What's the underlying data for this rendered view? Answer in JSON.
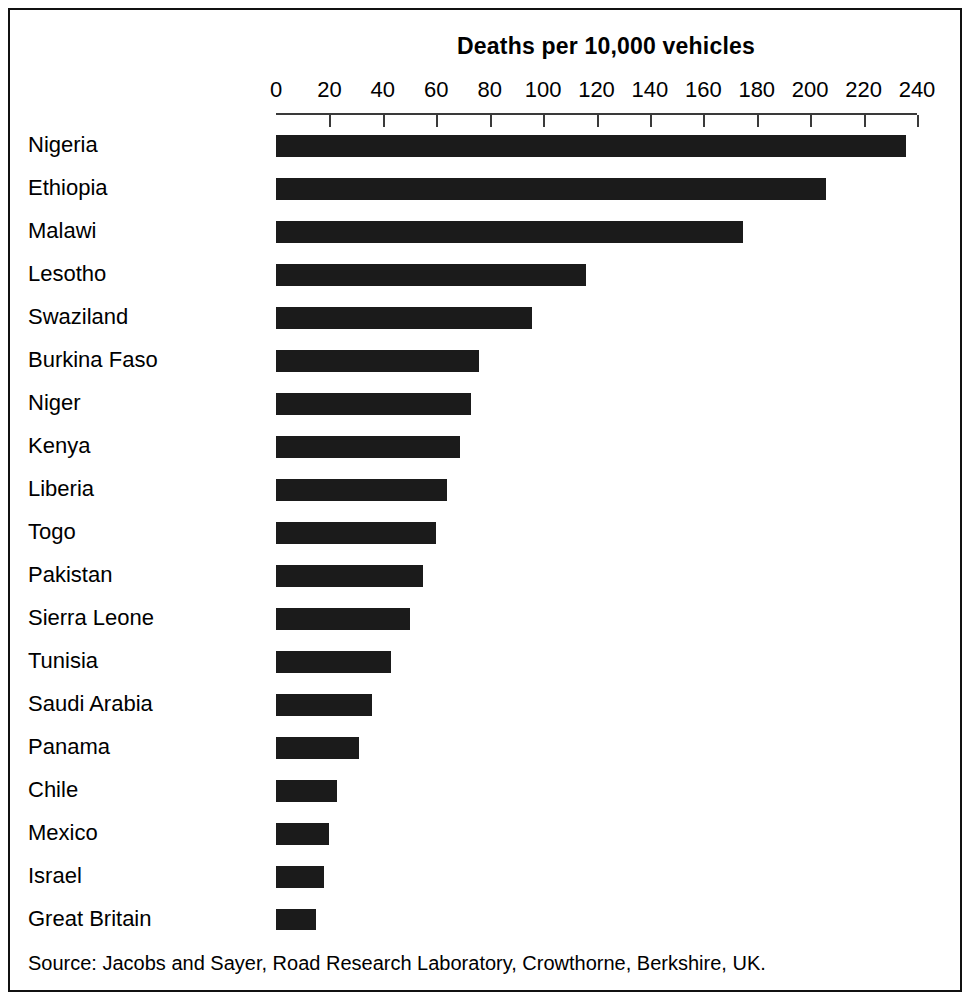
{
  "figure": {
    "title": "Deaths per 10,000 vehicles",
    "source_note": "Source: Jacobs and Sayer, Road Research Laboratory, Crowthorne, Berkshire, UK."
  },
  "chart_data": {
    "type": "bar",
    "orientation": "horizontal",
    "title": "Deaths per 10,000 vehicles",
    "xlabel": "Deaths per 10,000 vehicles",
    "ylabel": "",
    "xlim": [
      0,
      240
    ],
    "grid": false,
    "legend": null,
    "bar_color": "#1b1b1b",
    "axis_color": "#3a3a3a",
    "tick_labels": [
      "0",
      "20",
      "40",
      "60",
      "80",
      "100",
      "120",
      "140",
      "160",
      "180",
      "200",
      "220",
      "240"
    ],
    "ticks": [
      0,
      20,
      40,
      60,
      80,
      100,
      120,
      140,
      160,
      180,
      200,
      220,
      240
    ],
    "categories": [
      "Nigeria",
      "Ethiopia",
      "Malawi",
      "Lesotho",
      "Swaziland",
      "Burkina Faso",
      "Niger",
      "Kenya",
      "Liberia",
      "Togo",
      "Pakistan",
      "Sierra Leone",
      "Tunisia",
      "Saudi Arabia",
      "Panama",
      "Chile",
      "Mexico",
      "Israel",
      "Great Britain"
    ],
    "values": [
      236,
      206,
      175,
      116,
      96,
      76,
      73,
      69,
      64,
      60,
      55,
      50,
      43,
      36,
      31,
      23,
      20,
      18,
      15
    ]
  }
}
